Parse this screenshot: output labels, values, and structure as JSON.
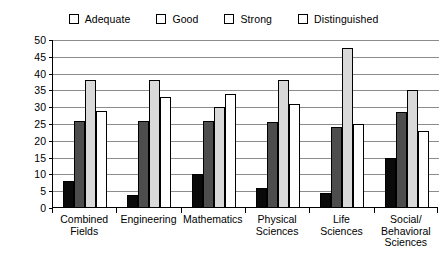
{
  "chart_data": {
    "type": "bar",
    "title": "",
    "xlabel": "",
    "ylabel": "Percent",
    "ylim": [
      0,
      50
    ],
    "ytick_step": 5,
    "yticks": [
      0,
      5,
      10,
      15,
      20,
      25,
      30,
      35,
      40,
      45,
      50
    ],
    "grid": true,
    "legend_position": "top",
    "categories": [
      "Combined Fields",
      "Engineering",
      "Mathematics",
      "Physical Sciences",
      "Life Sciences",
      "Social/ Behavioral Sciences"
    ],
    "category_lines": [
      [
        "Combined",
        "Fields"
      ],
      [
        "Engineering"
      ],
      [
        "Mathematics"
      ],
      [
        "Physical",
        "Sciences"
      ],
      [
        "Life",
        "Sciences"
      ],
      [
        "Social/",
        "Behavioral",
        "Sciences"
      ]
    ],
    "series": [
      {
        "name": "Adequate",
        "color": "#0a0a0a",
        "values": [
          8,
          4,
          10,
          6,
          4.5,
          15
        ]
      },
      {
        "name": "Good",
        "color": "#4d4d4d",
        "values": [
          26,
          26,
          26,
          25.5,
          24,
          28.5
        ]
      },
      {
        "name": "Strong",
        "color": "#d9d9d9",
        "values": [
          38,
          38,
          30,
          38,
          47.5,
          35
        ]
      },
      {
        "name": "Distinguished",
        "color": "#ffffff",
        "values": [
          29,
          33,
          34,
          31,
          25,
          23
        ]
      }
    ]
  },
  "legend": {
    "items": [
      {
        "label": "Adequate"
      },
      {
        "label": "Good"
      },
      {
        "label": "Strong"
      },
      {
        "label": "Distinguished"
      }
    ]
  }
}
